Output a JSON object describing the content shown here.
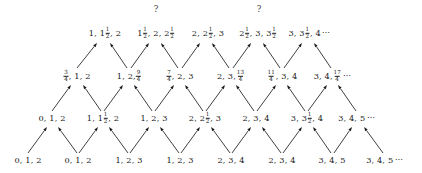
{
  "figure": {
    "background_color": "#ffffff",
    "text_color": "#191919",
    "arrow_color": "#1d1d1d",
    "ellipsis": "⋯",
    "question_mark": "?"
  },
  "markers": {
    "q1": "?",
    "q2": "?"
  },
  "rows": [
    {
      "id": "row-top",
      "y": 33,
      "nodes": [
        {
          "id": "t1",
          "x": 105,
          "parts": [
            {
              "t": "text",
              "v": "1, 1"
            },
            {
              "t": "frac",
              "n": "1",
              "d": "2"
            },
            {
              "t": "text",
              "v": ", 2"
            }
          ]
        },
        {
          "id": "t2",
          "x": 156,
          "parts": [
            {
              "t": "text",
              "v": "1"
            },
            {
              "t": "frac",
              "n": "1",
              "d": "2"
            },
            {
              "t": "text",
              "v": ", 2, 2"
            },
            {
              "t": "frac",
              "n": "1",
              "d": "2"
            }
          ]
        },
        {
          "id": "t3",
          "x": 208,
          "parts": [
            {
              "t": "text",
              "v": "2, 2"
            },
            {
              "t": "frac",
              "n": "1",
              "d": "2"
            },
            {
              "t": "text",
              "v": ", 3"
            }
          ]
        },
        {
          "id": "t4",
          "x": 258,
          "parts": [
            {
              "t": "text",
              "v": "2"
            },
            {
              "t": "frac",
              "n": "1",
              "d": "2"
            },
            {
              "t": "text",
              "v": ", 3, 3"
            },
            {
              "t": "frac",
              "n": "1",
              "d": "2"
            }
          ]
        },
        {
          "id": "t5",
          "x": 310,
          "parts": [
            {
              "t": "text",
              "v": "3, 3"
            },
            {
              "t": "frac",
              "n": "1",
              "d": "2"
            },
            {
              "t": "text",
              "v": ", 4"
            },
            {
              "t": "ell",
              "v": "⋯"
            }
          ]
        }
      ]
    },
    {
      "id": "row-2",
      "y": 76,
      "nodes": [
        {
          "id": "s1",
          "x": 77,
          "parts": [
            {
              "t": "frac",
              "n": "3",
              "d": "4"
            },
            {
              "t": "text",
              "v": ", 1, 2"
            }
          ]
        },
        {
          "id": "s2",
          "x": 129,
          "parts": [
            {
              "t": "text",
              "v": "1, 2, "
            },
            {
              "t": "frac",
              "n": "9",
              "d": "4"
            }
          ]
        },
        {
          "id": "s3",
          "x": 180,
          "parts": [
            {
              "t": "frac",
              "n": "7",
              "d": "4"
            },
            {
              "t": "text",
              "v": ", 2, 3"
            }
          ]
        },
        {
          "id": "s4",
          "x": 231,
          "parts": [
            {
              "t": "text",
              "v": "2, 3, "
            },
            {
              "t": "frac",
              "n": "13",
              "d": "4"
            }
          ]
        },
        {
          "id": "s5",
          "x": 282,
          "parts": [
            {
              "t": "frac",
              "n": "11",
              "d": "4"
            },
            {
              "t": "text",
              "v": ", 3, 4"
            }
          ]
        },
        {
          "id": "s6",
          "x": 333,
          "parts": [
            {
              "t": "text",
              "v": "3, 4, "
            },
            {
              "t": "frac",
              "n": "17",
              "d": "4"
            },
            {
              "t": "ell",
              "v": "⋯"
            }
          ]
        }
      ]
    },
    {
      "id": "row-3",
      "y": 118,
      "nodes": [
        {
          "id": "r1",
          "x": 52,
          "parts": [
            {
              "t": "text",
              "v": "0, 1, 2"
            }
          ]
        },
        {
          "id": "r2",
          "x": 103,
          "parts": [
            {
              "t": "text",
              "v": "1, 1"
            },
            {
              "t": "frac",
              "n": "1",
              "d": "2"
            },
            {
              "t": "text",
              "v": ", 2"
            }
          ]
        },
        {
          "id": "r3",
          "x": 154,
          "parts": [
            {
              "t": "text",
              "v": "1, 2, 3"
            }
          ]
        },
        {
          "id": "r4",
          "x": 205,
          "parts": [
            {
              "t": "text",
              "v": "2, 2"
            },
            {
              "t": "frac",
              "n": "1",
              "d": "2"
            },
            {
              "t": "text",
              "v": ", 3"
            }
          ]
        },
        {
          "id": "r5",
          "x": 256,
          "parts": [
            {
              "t": "text",
              "v": "2, 3, 4"
            }
          ]
        },
        {
          "id": "r6",
          "x": 307,
          "parts": [
            {
              "t": "text",
              "v": "3, 3"
            },
            {
              "t": "frac",
              "n": "1",
              "d": "2"
            },
            {
              "t": "text",
              "v": ", 4"
            }
          ]
        },
        {
          "id": "r7",
          "x": 357,
          "parts": [
            {
              "t": "text",
              "v": "3, 4, 5"
            },
            {
              "t": "ell",
              "v": "⋯"
            }
          ]
        }
      ]
    },
    {
      "id": "row-bottom",
      "y": 160,
      "nodes": [
        {
          "id": "b1",
          "x": 28,
          "parts": [
            {
              "t": "text",
              "v": "0, 1, 2"
            }
          ]
        },
        {
          "id": "b2",
          "x": 78,
          "parts": [
            {
              "t": "text",
              "v": "0, 1, 2"
            }
          ]
        },
        {
          "id": "b3",
          "x": 129,
          "parts": [
            {
              "t": "text",
              "v": "1, 2, 3"
            }
          ]
        },
        {
          "id": "b4",
          "x": 180,
          "parts": [
            {
              "t": "text",
              "v": "1, 2, 3"
            }
          ]
        },
        {
          "id": "b5",
          "x": 231,
          "parts": [
            {
              "t": "text",
              "v": "2, 3, 4"
            }
          ]
        },
        {
          "id": "b6",
          "x": 282,
          "parts": [
            {
              "t": "text",
              "v": "2, 3, 4"
            }
          ]
        },
        {
          "id": "b7",
          "x": 332,
          "parts": [
            {
              "t": "text",
              "v": "3, 4, 5"
            }
          ]
        },
        {
          "id": "b8",
          "x": 385,
          "parts": [
            {
              "t": "text",
              "v": "3, 4, 5"
            },
            {
              "t": "ell",
              "v": "⋯"
            }
          ]
        }
      ]
    }
  ],
  "qmarks": [
    {
      "id": "q-left",
      "x": 156,
      "y": 9,
      "label": "?"
    },
    {
      "id": "q-right",
      "x": 259,
      "y": 9,
      "label": "?"
    }
  ],
  "arrows": [
    {
      "from": [
        28,
        153
      ],
      "to": [
        47,
        127
      ]
    },
    {
      "from": [
        77,
        153
      ],
      "to": [
        58,
        127
      ]
    },
    {
      "from": [
        79,
        153
      ],
      "to": [
        98,
        127
      ]
    },
    {
      "from": [
        128,
        153
      ],
      "to": [
        109,
        127
      ]
    },
    {
      "from": [
        130,
        153
      ],
      "to": [
        149,
        127
      ]
    },
    {
      "from": [
        179,
        153
      ],
      "to": [
        160,
        127
      ]
    },
    {
      "from": [
        181,
        153
      ],
      "to": [
        200,
        127
      ]
    },
    {
      "from": [
        230,
        153
      ],
      "to": [
        211,
        127
      ]
    },
    {
      "from": [
        232,
        153
      ],
      "to": [
        251,
        127
      ]
    },
    {
      "from": [
        281,
        153
      ],
      "to": [
        262,
        127
      ]
    },
    {
      "from": [
        283,
        153
      ],
      "to": [
        302,
        127
      ]
    },
    {
      "from": [
        331,
        153
      ],
      "to": [
        313,
        127
      ]
    },
    {
      "from": [
        334,
        153
      ],
      "to": [
        352,
        127
      ]
    },
    {
      "from": [
        383,
        153
      ],
      "to": [
        364,
        127
      ]
    },
    {
      "from": [
        52,
        111
      ],
      "to": [
        71,
        85
      ]
    },
    {
      "from": [
        101,
        111
      ],
      "to": [
        83,
        85
      ]
    },
    {
      "from": [
        104,
        111
      ],
      "to": [
        123,
        85
      ]
    },
    {
      "from": [
        152,
        111
      ],
      "to": [
        134,
        85
      ]
    },
    {
      "from": [
        155,
        111
      ],
      "to": [
        174,
        85
      ]
    },
    {
      "from": [
        203,
        111
      ],
      "to": [
        185,
        85
      ]
    },
    {
      "from": [
        206,
        111
      ],
      "to": [
        225,
        85
      ]
    },
    {
      "from": [
        254,
        111
      ],
      "to": [
        236,
        85
      ]
    },
    {
      "from": [
        257,
        111
      ],
      "to": [
        276,
        85
      ]
    },
    {
      "from": [
        305,
        111
      ],
      "to": [
        287,
        85
      ]
    },
    {
      "from": [
        308,
        111
      ],
      "to": [
        327,
        85
      ]
    },
    {
      "from": [
        356,
        111
      ],
      "to": [
        338,
        85
      ]
    },
    {
      "from": [
        77,
        68
      ],
      "to": [
        97,
        43
      ]
    },
    {
      "from": [
        127,
        68
      ],
      "to": [
        110,
        43
      ]
    },
    {
      "from": [
        131,
        68
      ],
      "to": [
        149,
        43
      ]
    },
    {
      "from": [
        178,
        68
      ],
      "to": [
        161,
        43
      ]
    },
    {
      "from": [
        182,
        68
      ],
      "to": [
        200,
        43
      ]
    },
    {
      "from": [
        229,
        68
      ],
      "to": [
        212,
        43
      ]
    },
    {
      "from": [
        233,
        68
      ],
      "to": [
        251,
        43
      ]
    },
    {
      "from": [
        280,
        68
      ],
      "to": [
        263,
        43
      ]
    },
    {
      "from": [
        284,
        68
      ],
      "to": [
        302,
        43
      ]
    },
    {
      "from": [
        331,
        68
      ],
      "to": [
        314,
        43
      ]
    }
  ]
}
